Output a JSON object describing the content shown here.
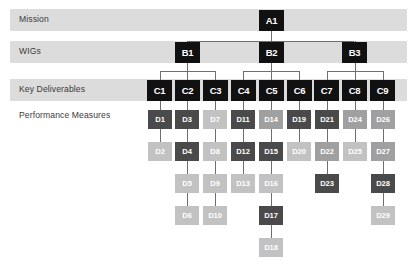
{
  "diagram": {
    "rows": [
      {
        "id": "mission",
        "label": "Mission",
        "banded": true
      },
      {
        "id": "wigs",
        "label": "WIGs",
        "banded": true
      },
      {
        "id": "key",
        "label": "Key Deliverables",
        "banded": true
      },
      {
        "id": "perf",
        "label": "Performance Measures",
        "banded": false
      }
    ],
    "colors": {
      "band": "#dcdcdc",
      "node_dark_fill": "#111111",
      "node_text": "#ffffff",
      "label_text": "#3a3a3a",
      "connector": "#6e6e6e",
      "shade_dark": "#4a4a4a",
      "shade_mid": "#a0a0a0",
      "shade_light": "#c2c2c2",
      "background": "#ffffff"
    },
    "mission_nodes": [
      {
        "id": "A1",
        "label": "A1",
        "col": 5
      }
    ],
    "wig_nodes": [
      {
        "id": "B1",
        "label": "B1",
        "col": 2
      },
      {
        "id": "B2",
        "label": "B2",
        "col": 5
      },
      {
        "id": "B3",
        "label": "B3",
        "col": 8
      }
    ],
    "deliverable_nodes": [
      {
        "id": "C1",
        "label": "C1",
        "col": 1,
        "parent": "B1"
      },
      {
        "id": "C2",
        "label": "C2",
        "col": 2,
        "parent": "B1"
      },
      {
        "id": "C3",
        "label": "C3",
        "col": 3,
        "parent": "B1"
      },
      {
        "id": "C4",
        "label": "C4",
        "col": 4,
        "parent": "B2"
      },
      {
        "id": "C5",
        "label": "C5",
        "col": 5,
        "parent": "B2"
      },
      {
        "id": "C6",
        "label": "C6",
        "col": 6,
        "parent": "B2"
      },
      {
        "id": "C7",
        "label": "C7",
        "col": 7,
        "parent": "B3"
      },
      {
        "id": "C8",
        "label": "C8",
        "col": 8,
        "parent": "B3"
      },
      {
        "id": "C9",
        "label": "C9",
        "col": 9,
        "parent": "B3"
      }
    ],
    "measure_columns": [
      {
        "col": 1,
        "parent": "C1",
        "nodes": [
          {
            "id": "D1",
            "label": "D1",
            "shade": "dark"
          },
          {
            "id": "D2",
            "label": "D2",
            "shade": "light"
          }
        ]
      },
      {
        "col": 2,
        "parent": "C2",
        "nodes": [
          {
            "id": "D3",
            "label": "D3",
            "shade": "dark"
          },
          {
            "id": "D4",
            "label": "D4",
            "shade": "dark"
          },
          {
            "id": "D5",
            "label": "D5",
            "shade": "light"
          },
          {
            "id": "D6",
            "label": "D6",
            "shade": "light"
          }
        ]
      },
      {
        "col": 3,
        "parent": "C3",
        "nodes": [
          {
            "id": "D7",
            "label": "D7",
            "shade": "light"
          },
          {
            "id": "D8",
            "label": "D8",
            "shade": "light"
          },
          {
            "id": "D9",
            "label": "D9",
            "shade": "light"
          },
          {
            "id": "D10",
            "label": "D10",
            "shade": "light"
          }
        ]
      },
      {
        "col": 4,
        "parent": "C4",
        "nodes": [
          {
            "id": "D11",
            "label": "D11",
            "shade": "dark"
          },
          {
            "id": "D12",
            "label": "D12",
            "shade": "dark"
          },
          {
            "id": "D13",
            "label": "D13",
            "shade": "light"
          }
        ]
      },
      {
        "col": 5,
        "parent": "C5",
        "nodes": [
          {
            "id": "D14",
            "label": "D14",
            "shade": "mid"
          },
          {
            "id": "D15",
            "label": "D15",
            "shade": "dark"
          },
          {
            "id": "D16",
            "label": "D16",
            "shade": "light"
          },
          {
            "id": "D17",
            "label": "D17",
            "shade": "dark"
          },
          {
            "id": "D18",
            "label": "D18",
            "shade": "light"
          }
        ]
      },
      {
        "col": 6,
        "parent": "C6",
        "nodes": [
          {
            "id": "D19",
            "label": "D19",
            "shade": "dark"
          },
          {
            "id": "D20",
            "label": "D20",
            "shade": "light"
          }
        ]
      },
      {
        "col": 7,
        "parent": "C7",
        "nodes": [
          {
            "id": "D21",
            "label": "D21",
            "shade": "dark"
          },
          {
            "id": "D22",
            "label": "D22",
            "shade": "mid"
          },
          {
            "id": "D23",
            "label": "D23",
            "shade": "dark"
          }
        ]
      },
      {
        "col": 8,
        "parent": "C8",
        "nodes": [
          {
            "id": "D24",
            "label": "D24",
            "shade": "mid"
          },
          {
            "id": "D25",
            "label": "D25",
            "shade": "light"
          }
        ]
      },
      {
        "col": 9,
        "parent": "C9",
        "nodes": [
          {
            "id": "D26",
            "label": "D26",
            "shade": "mid"
          },
          {
            "id": "D27",
            "label": "D27",
            "shade": "mid"
          },
          {
            "id": "D28",
            "label": "D28",
            "shade": "dark"
          },
          {
            "id": "D29",
            "label": "D29",
            "shade": "light"
          }
        ]
      }
    ]
  },
  "layout": {
    "canvas_width": 418,
    "canvas_height": 269,
    "band_left": 10,
    "band_right": 407,
    "col1_center": 159.5,
    "col_pitch": 27.9,
    "box_w": 25,
    "box_h": 21,
    "d_box_w": 24,
    "d_box_h": 19,
    "row_a_center": 20,
    "row_b_center": 52,
    "row_c_center": 90,
    "row_d_start": 119,
    "row_d_pitch": 32
  }
}
